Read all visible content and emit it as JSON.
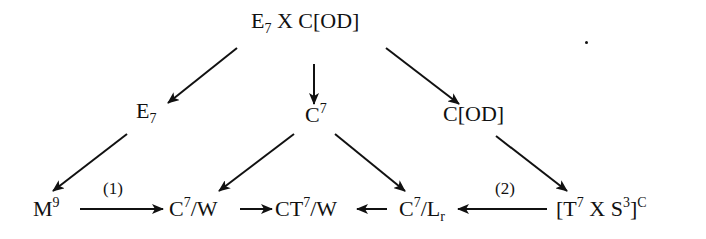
{
  "diagram": {
    "nodes": {
      "top": {
        "base": "E",
        "sub": "7",
        "rest": " X C[OD]"
      },
      "e7": {
        "base": "E",
        "sub": "7"
      },
      "c7": {
        "base": "C",
        "sup": "7"
      },
      "cod": {
        "label": "C[OD]"
      },
      "m9": {
        "base": "M",
        "sup": "9"
      },
      "c7w": {
        "base": "C",
        "sup": "7",
        "rest": "/W"
      },
      "ct7w": {
        "base": "CT",
        "sup": "7",
        "rest": "/W"
      },
      "c7lr": {
        "base": "C",
        "sup": "7",
        "mid": "/L",
        "sub": "r"
      },
      "t7s3c": {
        "pre": "[T",
        "sup1": "7",
        "mid": " X S",
        "sup2": "3",
        "close": "]",
        "sup3": "C"
      }
    },
    "edge_labels": {
      "m9_to_c7w": "(1)",
      "t7s3c_to_c7lr": "(2)"
    },
    "edges": [
      {
        "from": "top",
        "to": "e7"
      },
      {
        "from": "top",
        "to": "c7"
      },
      {
        "from": "top",
        "to": "cod"
      },
      {
        "from": "e7",
        "to": "m9"
      },
      {
        "from": "c7",
        "to": "c7w"
      },
      {
        "from": "c7",
        "to": "c7lr"
      },
      {
        "from": "cod",
        "to": "t7s3c"
      },
      {
        "from": "m9",
        "to": "c7w",
        "label": "(1)"
      },
      {
        "from": "c7w",
        "to": "ct7w"
      },
      {
        "from": "c7lr",
        "to": "ct7w"
      },
      {
        "from": "t7s3c",
        "to": "c7lr",
        "label": "(2)"
      }
    ],
    "colors": {
      "ink": "#111111",
      "background": "#ffffff"
    }
  }
}
